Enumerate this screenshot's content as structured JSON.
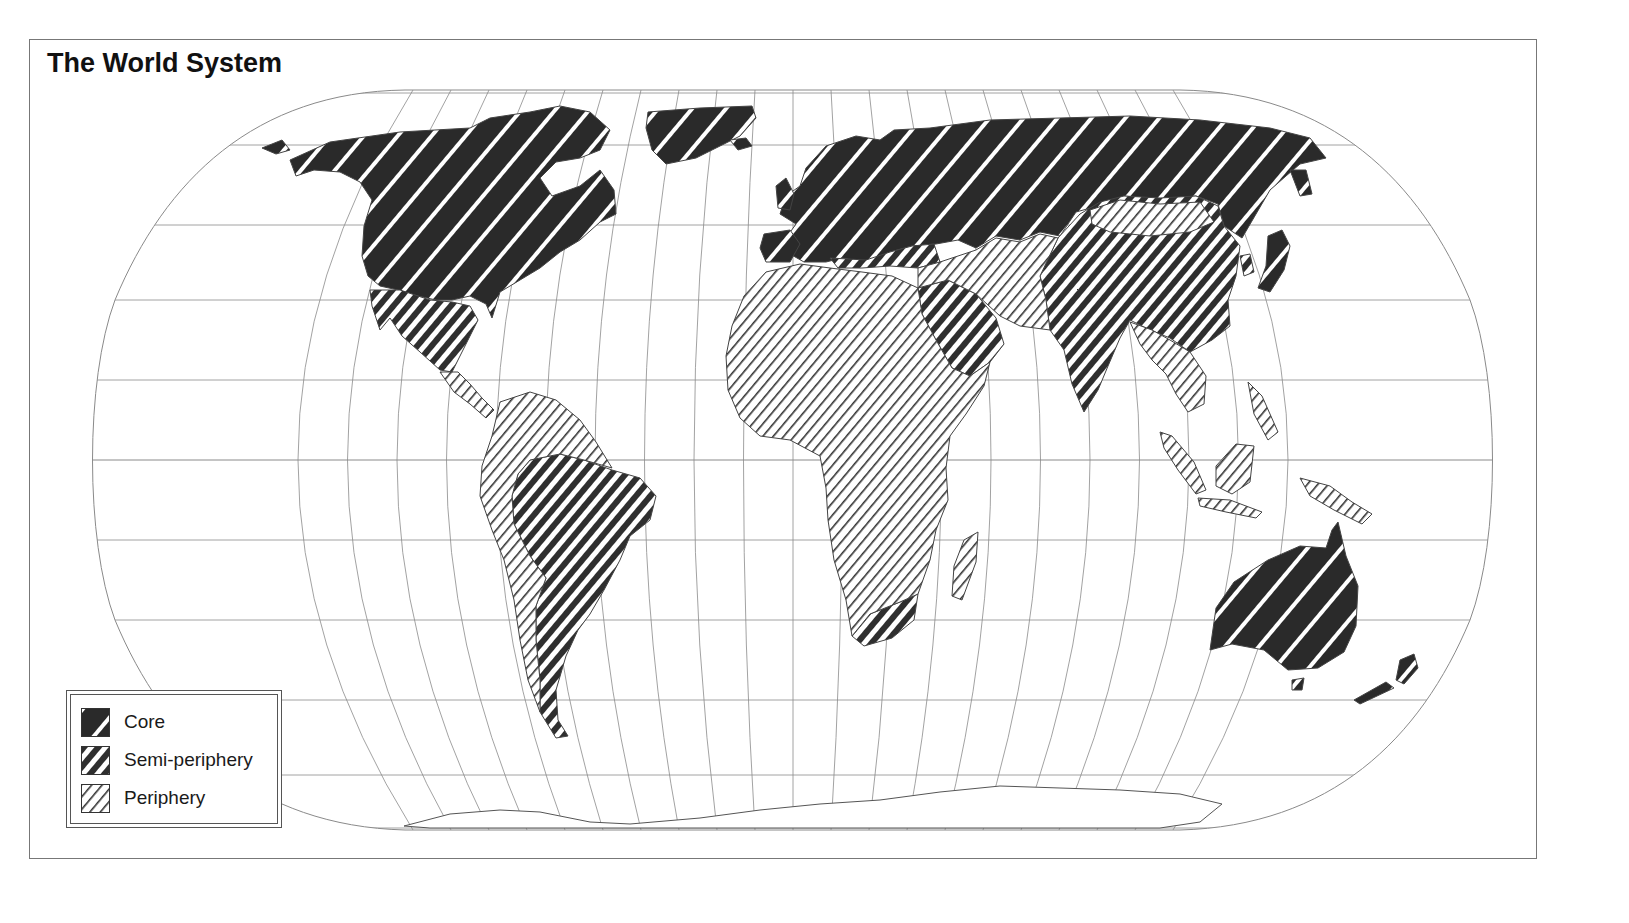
{
  "title": "The World System",
  "legend": {
    "items": [
      {
        "label": "Core",
        "pattern": "core-pattern"
      },
      {
        "label": "Semi-periphery",
        "pattern": "semi-periphery-pattern"
      },
      {
        "label": "Periphery",
        "pattern": "periphery-pattern"
      }
    ]
  },
  "colors": {
    "ink": "#2a2a2a",
    "graticule": "#8a8a8a",
    "background": "#ffffff"
  },
  "map": {
    "projection": "Robinson-like pseudocylindrical",
    "classification": {
      "core": [
        "North America (USA, Canada)",
        "Western Europe",
        "Russia / USSR",
        "Japan",
        "Australia",
        "New Zealand",
        "Greenland"
      ],
      "semi_periphery": [
        "Mexico",
        "Brazil",
        "Argentina",
        "Chile",
        "South Africa",
        "Middle East (Saudi Arabia, Iran)",
        "China",
        "India",
        "South Korea",
        "Eastern Europe"
      ],
      "periphery": [
        "Central America",
        "Andean South America",
        "Most of Africa",
        "Central Asia",
        "Mongolia",
        "Southeast Asia",
        "Indonesia",
        "Papua New Guinea",
        "Madagascar"
      ]
    }
  }
}
